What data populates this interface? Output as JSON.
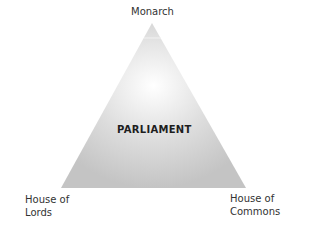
{
  "diagram": {
    "type": "triangle",
    "center_label": "PARLIAMENT",
    "vertices": {
      "top": "Monarch",
      "bottom_left": [
        "House of",
        "Lords"
      ],
      "bottom_right": [
        "House of",
        "Commons"
      ]
    },
    "colors": {
      "fill_edge": "#c8c8c8",
      "fill_center": "#ffffff",
      "text": "#333333"
    }
  }
}
